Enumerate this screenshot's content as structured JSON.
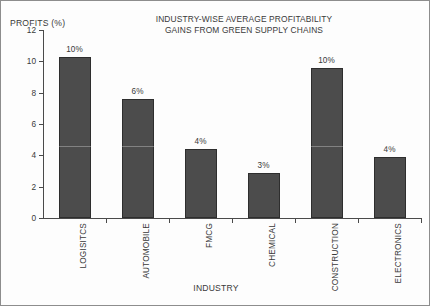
{
  "chart_data": {
    "type": "bar",
    "title": "INDUSTRY-WISE AVERAGE PROFITABILITY\nGAINS FROM GREEN SUPPLY CHAINS",
    "ylabel": "PROFITS (%)",
    "xlabel": "INDUSTRY",
    "ylim": [
      0,
      12
    ],
    "yticks": [
      0,
      2,
      4,
      6,
      8,
      10,
      12
    ],
    "ytick_labels": [
      "0",
      "2",
      "4",
      "6",
      "8",
      "10",
      "12"
    ],
    "grid": false,
    "legend": false,
    "categories": [
      "LOGISITCS",
      "AUTOMOBILE",
      "FMCG",
      "CHEMICAL",
      "CONSTRUCTION",
      "ELECTRONICS"
    ],
    "values": [
      10.3,
      7.6,
      4.4,
      2.9,
      9.6,
      3.9
    ],
    "data_labels": [
      "10%",
      "6%",
      "4%",
      "3%",
      "10%",
      "4%"
    ],
    "bar_color": "#4c4c4c",
    "bar_edge_color": "#2e2e2e",
    "axis_color": "#4a4a4a",
    "text_color": "#3a3a3a",
    "background_color": "#fdfdfd",
    "border_color": "#8d8d8d"
  }
}
